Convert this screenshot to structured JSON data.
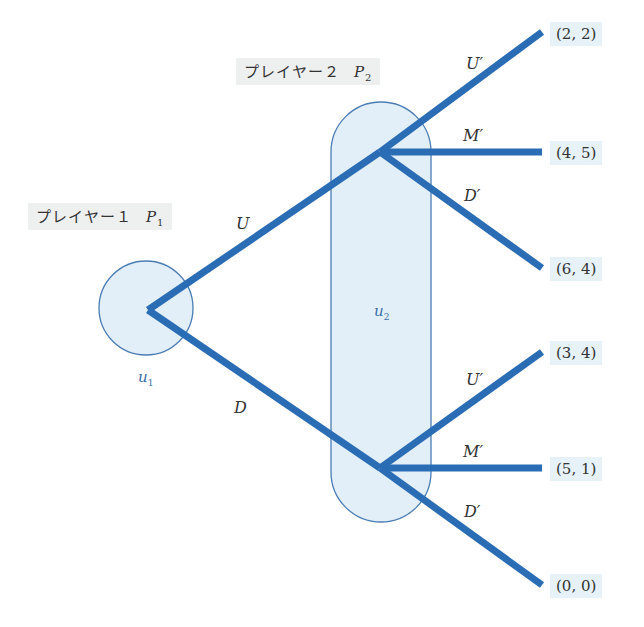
{
  "players": {
    "p1": {
      "label": "プレイヤー１",
      "symbol": "P",
      "subscript": "1"
    },
    "p2": {
      "label": "プレイヤー２",
      "symbol": "P",
      "subscript": "2"
    }
  },
  "information_sets": {
    "u1": {
      "symbol": "u",
      "subscript": "1"
    },
    "u2": {
      "symbol": "u",
      "subscript": "2"
    }
  },
  "actions": {
    "p1": [
      "U",
      "D"
    ],
    "p2_upper": [
      "U′",
      "M′",
      "D′"
    ],
    "p2_lower": [
      "U′",
      "M′",
      "D′"
    ]
  },
  "payoffs": [
    "(2, 2)",
    "(4, 5)",
    "(6, 4)",
    "(3, 4)",
    "(5, 1)",
    "(0, 0)"
  ],
  "colors": {
    "edge": "#2a6db5",
    "infoset_fill": "#e3eff8",
    "infoset_stroke": "#4a7db4",
    "payoff_bg": "#e6f1f8",
    "player_bg": "#eef0f0"
  }
}
